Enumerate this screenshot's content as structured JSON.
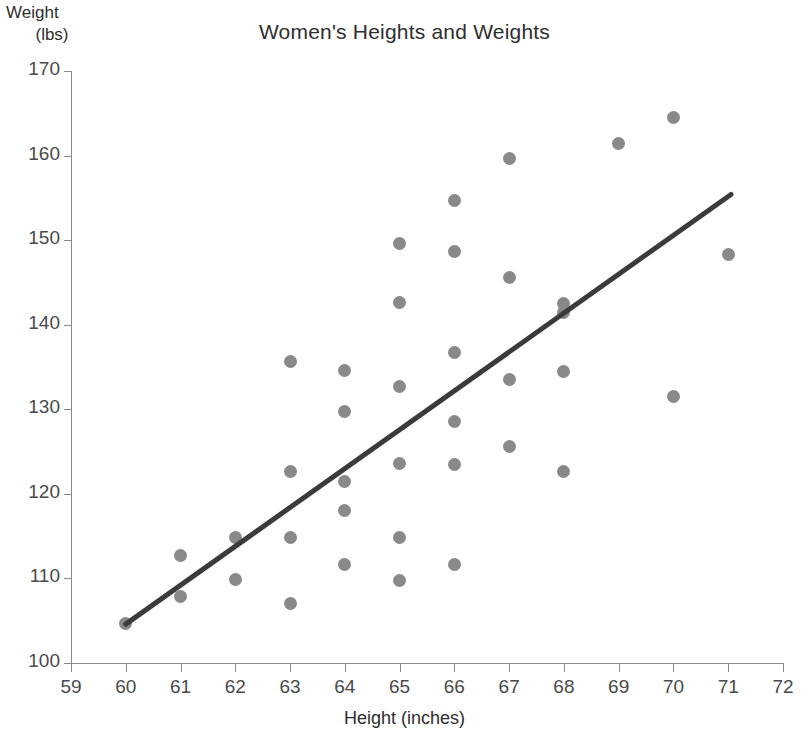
{
  "chart_data": {
    "type": "scatter",
    "title": "Women's Heights and Weights",
    "xlabel": "Height (inches)",
    "ylabel": "Weight (lbs)",
    "ylabel_line1": "Weight",
    "ylabel_line2": "(lbs)",
    "xlim": [
      59,
      72
    ],
    "ylim": [
      100,
      170
    ],
    "xticks": [
      59,
      60,
      61,
      62,
      63,
      64,
      65,
      66,
      67,
      68,
      69,
      70,
      71,
      72
    ],
    "yticks": [
      100,
      110,
      120,
      130,
      140,
      150,
      160,
      170
    ],
    "grid": false,
    "legend": null,
    "marker_color": "#898989",
    "trendline_color": "#3b3b3b",
    "axis_color": "#8a8a8a",
    "points": [
      {
        "x": 60,
        "y": 104.7
      },
      {
        "x": 61,
        "y": 112.7
      },
      {
        "x": 61,
        "y": 107.9
      },
      {
        "x": 62,
        "y": 114.8
      },
      {
        "x": 62,
        "y": 109.9
      },
      {
        "x": 63,
        "y": 135.6
      },
      {
        "x": 63,
        "y": 122.6
      },
      {
        "x": 63,
        "y": 114.8
      },
      {
        "x": 63,
        "y": 107.0
      },
      {
        "x": 64,
        "y": 134.6
      },
      {
        "x": 64,
        "y": 129.7
      },
      {
        "x": 64,
        "y": 121.5
      },
      {
        "x": 64,
        "y": 118.0
      },
      {
        "x": 64,
        "y": 111.7
      },
      {
        "x": 65,
        "y": 149.6
      },
      {
        "x": 65,
        "y": 142.6
      },
      {
        "x": 65,
        "y": 132.7
      },
      {
        "x": 65,
        "y": 123.6
      },
      {
        "x": 65,
        "y": 114.8
      },
      {
        "x": 65,
        "y": 109.7
      },
      {
        "x": 66,
        "y": 154.7
      },
      {
        "x": 66,
        "y": 148.6
      },
      {
        "x": 66,
        "y": 136.7
      },
      {
        "x": 66,
        "y": 128.6
      },
      {
        "x": 66,
        "y": 123.5
      },
      {
        "x": 66,
        "y": 111.7
      },
      {
        "x": 67,
        "y": 159.6
      },
      {
        "x": 67,
        "y": 145.6
      },
      {
        "x": 67,
        "y": 133.5
      },
      {
        "x": 67,
        "y": 125.6
      },
      {
        "x": 68,
        "y": 142.5
      },
      {
        "x": 68,
        "y": 141.5
      },
      {
        "x": 68,
        "y": 134.5
      },
      {
        "x": 68,
        "y": 122.7
      },
      {
        "x": 69,
        "y": 161.4
      },
      {
        "x": 70,
        "y": 164.5
      },
      {
        "x": 70,
        "y": 131.5
      },
      {
        "x": 71,
        "y": 148.3
      }
    ],
    "trendline": {
      "x0": 60,
      "y0": 104.6,
      "x1": 71.05,
      "y1": 155.4
    }
  }
}
